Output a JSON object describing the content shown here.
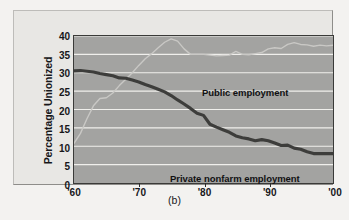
{
  "figure": {
    "caption": "(b)",
    "panel_bg": "#a3a3a1",
    "frame_bg": "#e8e7e4"
  },
  "chart_data": {
    "type": "line",
    "title": "",
    "xlabel": "",
    "ylabel": "Percentage Unionized",
    "xlim": [
      1960,
      2000
    ],
    "ylim": [
      0,
      40
    ],
    "grid": true,
    "grid_color": "#f0efec",
    "legend": "inline-labels",
    "xtick_labels": [
      "'60",
      "'70",
      "'80",
      "'90",
      "'00"
    ],
    "xtick_values": [
      1960,
      1970,
      1980,
      1990,
      2000
    ],
    "ytick_labels": [
      "0",
      "5",
      "10",
      "15",
      "20",
      "25",
      "30",
      "35",
      "40"
    ],
    "ytick_values": [
      0,
      5,
      10,
      15,
      20,
      25,
      30,
      35,
      40
    ],
    "series": [
      {
        "name": "Public employment",
        "color": "#c9c8c5",
        "width": 1.4,
        "label": "Public employment",
        "x": [
          1960,
          1961,
          1962,
          1963,
          1964,
          1965,
          1966,
          1967,
          1968,
          1969,
          1970,
          1971,
          1972,
          1973,
          1974,
          1975,
          1976,
          1977,
          1978,
          1979,
          1980,
          1981,
          1982,
          1983,
          1984,
          1985,
          1986,
          1987,
          1988,
          1989,
          1990,
          1991,
          1992,
          1993,
          1994,
          1995,
          1996,
          1997,
          1998,
          1999,
          2000
        ],
        "values": [
          10.8,
          13.5,
          17.5,
          21.0,
          23.0,
          23.2,
          24.5,
          26.5,
          28.2,
          30.0,
          32.0,
          33.8,
          35.2,
          36.8,
          38.3,
          39.2,
          38.6,
          36.5,
          35.0,
          35.0,
          35.0,
          34.8,
          34.6,
          34.7,
          34.8,
          35.8,
          35.0,
          34.9,
          35.2,
          35.5,
          36.5,
          36.8,
          36.6,
          37.7,
          38.2,
          37.7,
          37.6,
          37.2,
          37.5,
          37.3,
          37.5
        ]
      },
      {
        "name": "Private nonfarm employment",
        "color": "#3d3d3b",
        "width": 3.2,
        "label": "Private nonfarm employment",
        "x": [
          1960,
          1961,
          1962,
          1963,
          1964,
          1965,
          1966,
          1967,
          1968,
          1969,
          1970,
          1971,
          1972,
          1973,
          1974,
          1975,
          1976,
          1977,
          1978,
          1979,
          1980,
          1981,
          1982,
          1983,
          1984,
          1985,
          1986,
          1987,
          1988,
          1989,
          1990,
          1991,
          1992,
          1993,
          1994,
          1995,
          1996,
          1997,
          1998,
          1999,
          2000
        ],
        "values": [
          30.5,
          30.6,
          30.4,
          30.2,
          29.8,
          29.5,
          29.2,
          28.6,
          28.5,
          28.0,
          27.5,
          26.8,
          26.2,
          25.5,
          24.8,
          23.8,
          22.6,
          21.5,
          20.3,
          19.0,
          18.4,
          16.0,
          15.2,
          14.5,
          13.8,
          12.8,
          12.3,
          12.0,
          11.5,
          11.8,
          11.5,
          10.9,
          10.2,
          10.3,
          9.5,
          9.2,
          8.5,
          8.0,
          8.0,
          8.0,
          8.0
        ]
      }
    ]
  }
}
